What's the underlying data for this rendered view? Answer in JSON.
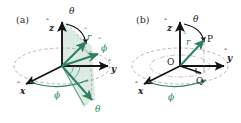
{
  "figure": {
    "type": "diagram",
    "background_color": "#ffffff",
    "axis_color": "#141414",
    "accent_color": "#2f7f63",
    "fill_color": "#cfe4d9",
    "dashed_color": "#9a9a9a"
  },
  "panels": [
    {
      "id": "a",
      "label": "(a)",
      "caption_position": "top-left",
      "description": "Spherical unit vectors r-hat, theta-hat, phi-hat at a point, with the phi = const half-plane shaded",
      "labels": {
        "z_axis": "z",
        "x_axis": "x",
        "y_axis": "y",
        "r_unit": "r",
        "theta_unit": "θ",
        "phi_unit": "ϕ",
        "theta_angle": "θ",
        "phi_angle": "ϕ"
      },
      "hat_marks": [
        "z",
        "x",
        "y",
        "r",
        "θ",
        "ϕ"
      ],
      "angle_arcs": [
        {
          "name": "theta",
          "from": "z-axis",
          "to": "r-hat",
          "color": "#141414"
        },
        {
          "name": "phi",
          "from": "x-axis",
          "to": "projection",
          "color": "#2f7f63"
        }
      ]
    },
    {
      "id": "b",
      "label": "(b)",
      "caption_position": "top-left",
      "description": "Point P with position vector r from origin O, polar angle theta from z-axis, azimuth phi from x-axis, projection Q in the xy-plane",
      "labels": {
        "z_axis": "z",
        "x_axis": "x",
        "y_axis": "y",
        "r_vector": "r",
        "theta_angle": "θ",
        "phi_angle": "ϕ",
        "origin": "O",
        "point": "P",
        "projection": "Q"
      },
      "hat_marks": [
        "z",
        "x",
        "y",
        "r"
      ],
      "angle_arcs": [
        {
          "name": "theta",
          "from": "z-axis",
          "to": "r-vector",
          "color": "#141414"
        },
        {
          "name": "phi",
          "from": "x-axis",
          "to": "OQ",
          "color": "#2f7f63"
        }
      ],
      "guides": [
        {
          "name": "PQ",
          "style": "dash-dot",
          "color": "#9a9a9a"
        },
        {
          "name": "right-angle-marker",
          "at": "Q",
          "color": "#141414"
        }
      ]
    }
  ]
}
